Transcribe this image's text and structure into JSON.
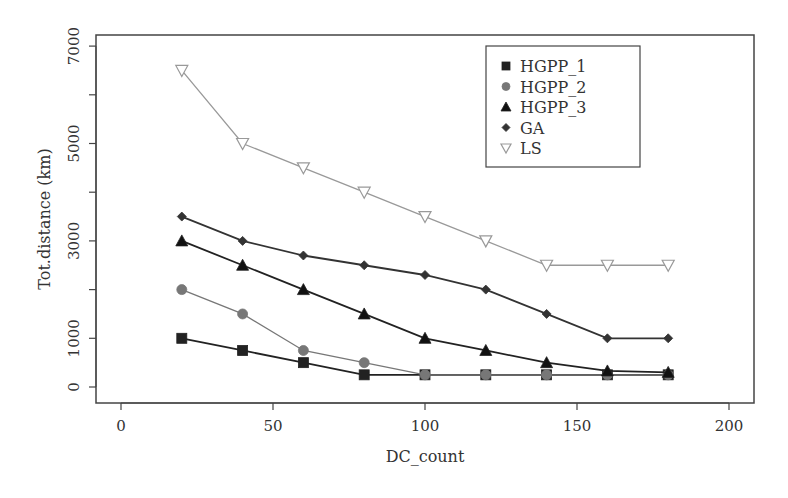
{
  "chart_data": {
    "type": "line",
    "title": "",
    "xlabel": "DC_count",
    "ylabel": "Tot.distance (km)",
    "xlim": [
      -8,
      208
    ],
    "ylim": [
      -320,
      7250
    ],
    "x_ticks": [
      0,
      50,
      100,
      150,
      200
    ],
    "x_tick_labels": [
      "0",
      "50",
      "100",
      "150",
      "200"
    ],
    "y_ticks": [
      0,
      1000,
      2000,
      3000,
      4000,
      5000,
      6000,
      7000
    ],
    "y_tick_labels": [
      "0",
      "1000",
      "",
      "3000",
      "",
      "5000",
      "",
      "7000"
    ],
    "grid": false,
    "legend_position": "top-right (inside plot)",
    "x": [
      20,
      40,
      60,
      80,
      100,
      120,
      140,
      160,
      180
    ],
    "series": [
      {
        "name": "HGPP_1",
        "marker": "square",
        "color": "#222222",
        "marker_fill": "#222222",
        "values": [
          1000,
          750,
          500,
          250,
          250,
          250,
          250,
          250,
          250
        ]
      },
      {
        "name": "HGPP_2",
        "marker": "circle",
        "color": "#777777",
        "marker_fill": "#777777",
        "values": [
          2000,
          1500,
          750,
          500,
          250,
          250,
          250,
          250,
          250
        ]
      },
      {
        "name": "HGPP_3",
        "marker": "triangle-up",
        "color": "#222222",
        "marker_fill": "#111111",
        "values": [
          3000,
          2500,
          2000,
          1500,
          1000,
          750,
          500,
          330,
          300
        ]
      },
      {
        "name": "GA",
        "marker": "diamond",
        "color": "#333333",
        "marker_fill": "#333333",
        "values": [
          3500,
          3000,
          2700,
          2500,
          2300,
          2000,
          1500,
          1000,
          1000
        ]
      },
      {
        "name": "LS",
        "marker": "triangle-down-open",
        "color": "#999999",
        "marker_fill": "none",
        "values": [
          6500,
          5000,
          4500,
          4000,
          3500,
          3000,
          2500,
          2500,
          2500
        ]
      }
    ]
  }
}
